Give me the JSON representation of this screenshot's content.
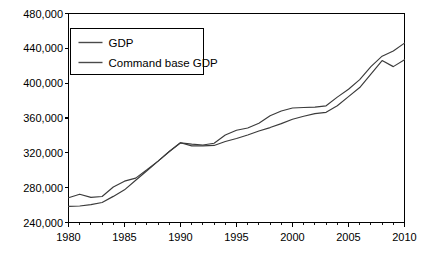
{
  "chart_data": {
    "type": "line",
    "title": "",
    "subtitle": "",
    "xlabel": "",
    "ylabel": "",
    "xlim": [
      1980,
      2010
    ],
    "ylim": [
      240000,
      480000
    ],
    "grid": false,
    "legend_position": "top-left",
    "x_ticks": [
      1980,
      1985,
      1990,
      1995,
      2000,
      2005,
      2010
    ],
    "x_tick_labels": [
      "1980",
      "1985",
      "1990",
      "1995",
      "2000",
      "2005",
      "2010"
    ],
    "x_minor_tick_step": 1,
    "y_ticks": [
      240000,
      280000,
      320000,
      360000,
      400000,
      440000,
      480000
    ],
    "y_tick_labels": [
      "240,000",
      "280,000",
      "320,000",
      "360,000",
      "400,000",
      "440,000",
      "480,000"
    ],
    "x": [
      1980,
      1981,
      1982,
      1983,
      1984,
      1985,
      1986,
      1987,
      1988,
      1989,
      1990,
      1991,
      1992,
      1993,
      1994,
      1995,
      1996,
      1997,
      1998,
      1999,
      2000,
      2001,
      2002,
      2003,
      2004,
      2005,
      2006,
      2007,
      2008,
      2009,
      2010
    ],
    "series": [
      {
        "name": "GDP",
        "color": "#3b3b3b",
        "values": [
          268500,
          272500,
          268800,
          269800,
          280700,
          287500,
          291000,
          300500,
          310500,
          321500,
          331500,
          330000,
          329000,
          331000,
          340500,
          346000,
          348500,
          354000,
          362500,
          368000,
          371500,
          372000,
          372500,
          374000,
          384000,
          393000,
          404000,
          419000,
          431000,
          437000,
          446000
        ]
      },
      {
        "name": "Command base GDP",
        "color": "#3b3b3b",
        "values": [
          258500,
          259000,
          260500,
          263000,
          270000,
          277500,
          288500,
          299500,
          310500,
          321500,
          331500,
          328000,
          328000,
          328500,
          333000,
          336500,
          340500,
          345000,
          349000,
          353500,
          358500,
          362000,
          365000,
          366500,
          374000,
          384500,
          395000,
          410500,
          426000,
          419000,
          427000
        ]
      }
    ]
  },
  "legend": {
    "items": [
      {
        "label": "GDP"
      },
      {
        "label": "Command base GDP"
      }
    ]
  },
  "axes": {
    "background_color": "#ffffff",
    "line_color": "#000000"
  }
}
